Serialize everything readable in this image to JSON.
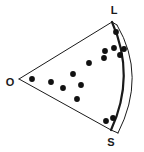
{
  "figure": {
    "background_color": "#ffffff",
    "stroke_color": "#1a1a1a",
    "dot_color": "#111111",
    "width": 144,
    "height": 152
  },
  "labels": {
    "origin": "O",
    "long_axis": "L",
    "short_axis": "S"
  },
  "geometry": {
    "origin_point": {
      "x": 19,
      "y": 79
    },
    "long_vertex": {
      "x": 112,
      "y": 22
    },
    "short_vertex": {
      "x": 111,
      "y": 130
    },
    "inner_arc_control": {
      "x": 136,
      "y": 76
    },
    "outer_arc_control": {
      "x": 147,
      "y": 76
    },
    "outer_arc_start": {
      "x": 117,
      "y": 25
    },
    "outer_arc_end": {
      "x": 118,
      "y": 133
    },
    "inner_arc_stroke_width": 2.2,
    "outer_arc_stroke_width": 1.0,
    "edge_stroke_width": 1.0
  },
  "label_positions": {
    "origin": {
      "x": 10,
      "y": 83
    },
    "long_axis": {
      "x": 114,
      "y": 11
    },
    "short_axis": {
      "x": 111,
      "y": 143
    }
  },
  "chart_data": {
    "type": "scatter",
    "xlabel": "",
    "ylabel": "",
    "grid": false,
    "legend": false,
    "dot_radius": 2.9,
    "point_count": 15,
    "points": [
      {
        "x": 32,
        "y": 79
      },
      {
        "x": 51,
        "y": 82
      },
      {
        "x": 73,
        "y": 74
      },
      {
        "x": 81,
        "y": 85
      },
      {
        "x": 77,
        "y": 99
      },
      {
        "x": 89,
        "y": 63
      },
      {
        "x": 116,
        "y": 32
      },
      {
        "x": 114,
        "y": 48
      },
      {
        "x": 105,
        "y": 51
      },
      {
        "x": 120,
        "y": 55
      },
      {
        "x": 104,
        "y": 58
      },
      {
        "x": 106,
        "y": 121
      },
      {
        "x": 113,
        "y": 118
      },
      {
        "x": 124,
        "y": 49
      },
      {
        "x": 63,
        "y": 88
      }
    ]
  }
}
